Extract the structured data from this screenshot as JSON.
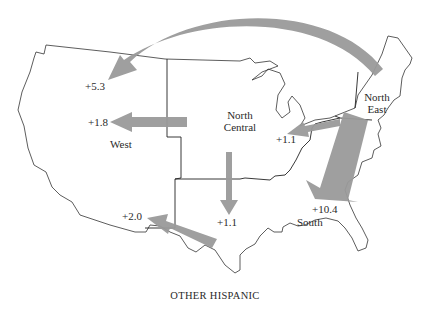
{
  "caption": "OTHER HISPANIC",
  "regions": {
    "west": "West",
    "north_central_line1": "North",
    "north_central_line2": "Central",
    "north_east_line1": "North",
    "north_east_line2": "East",
    "south": "South"
  },
  "flows": [
    {
      "from": "North East",
      "to": "West",
      "value": "+5.3"
    },
    {
      "from": "North Central",
      "to": "West",
      "value": "+1.8"
    },
    {
      "from": "North East",
      "to": "North Central",
      "value": "+1.1"
    },
    {
      "from": "North Central",
      "to": "South",
      "value": "+1.1"
    },
    {
      "from": "North East",
      "to": "South",
      "value": "+10.4"
    },
    {
      "from": "South",
      "to": "West",
      "value": "+2.0"
    }
  ],
  "colors": {
    "arrow": "#9a9a9a",
    "outline": "#333333",
    "background": "#ffffff"
  }
}
